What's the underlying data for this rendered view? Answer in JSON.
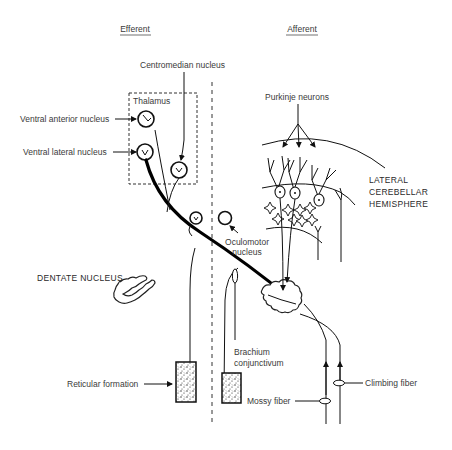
{
  "headers": {
    "efferent": "Efferent",
    "afferent": "Afferent"
  },
  "labels": {
    "centromedian_nucleus": "Centromedian nucleus",
    "thalamus": "Thalamus",
    "ventral_anterior_nucleus": "Ventral anterior nucleus",
    "ventral_lateral_nucleus": "Ventral lateral nucleus",
    "purkinje_neurons": "Purkinje neurons",
    "lateral_cerebellar_hemisphere": [
      "LATERAL",
      "CEREBELLAR",
      "HEMISPHERE"
    ],
    "oculomotor_nucleus": [
      "Oculomotor",
      "nucleus"
    ],
    "dentate_nucleus": "DENTATE NUCLEUS",
    "brachium_conjunctivum": [
      "Brachium",
      "conjunctivum"
    ],
    "reticular_formation": "Reticular formation",
    "climbing_fiber": "Climbing fiber",
    "mossy_fiber": "Mossy fiber"
  }
}
